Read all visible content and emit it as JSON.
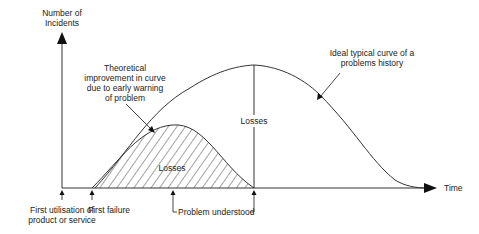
{
  "diagram": {
    "y_axis_label_line1": "Number of",
    "y_axis_label_line2": "Incidents",
    "x_axis_label": "Time",
    "ideal_curve_label_line1": "Ideal typical curve of a",
    "ideal_curve_label_line2": "problems history",
    "improved_curve_label_line1": "Theoretical",
    "improved_curve_label_line2": "improvement in curve",
    "improved_curve_label_line3": "due to early warning",
    "improved_curve_label_line4": "of problem",
    "losses_large_label": "Losses",
    "losses_small_label": "Losses",
    "marker_first_use_line1": "First utilisation of",
    "marker_first_use_line2": "product or service",
    "marker_first_failure": "First failure",
    "marker_problem_understood": "Problem understood",
    "line_color": "#333333",
    "background": "#ffffff"
  }
}
